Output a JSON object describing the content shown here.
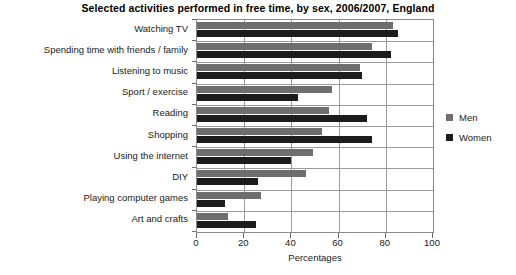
{
  "chart_data": {
    "type": "bar",
    "orientation": "horizontal",
    "title": "Selected activities performed in free time, by sex, 2006/2007, England",
    "xlabel": "Percentages",
    "ylabel": "",
    "xlim": [
      0,
      100
    ],
    "xticks": [
      0,
      20,
      40,
      60,
      80,
      100
    ],
    "xticklabels": [
      "0",
      "20",
      "40",
      "60",
      "80",
      "100"
    ],
    "grid": "vertical-and-horizontal",
    "legend_position": "right",
    "categories": [
      "Watching TV",
      "Spending time with friends / family",
      "Listening to music",
      "Sport / exercise",
      "Reading",
      "Shopping",
      "Using the internet",
      "DIY",
      "Playing computer games",
      "Art and crafts"
    ],
    "series": [
      {
        "name": "Men",
        "color": "#6e6e6e",
        "values": [
          83,
          74,
          69,
          57,
          56,
          53,
          49,
          46,
          27,
          13
        ]
      },
      {
        "name": "Women",
        "color": "#1c1c1c",
        "values": [
          85,
          82,
          70,
          43,
          72,
          74,
          40,
          26,
          12,
          25
        ]
      }
    ]
  },
  "legend": {
    "items": [
      {
        "label": "Men",
        "color": "#6e6e6e"
      },
      {
        "label": "Women",
        "color": "#1c1c1c"
      }
    ]
  }
}
